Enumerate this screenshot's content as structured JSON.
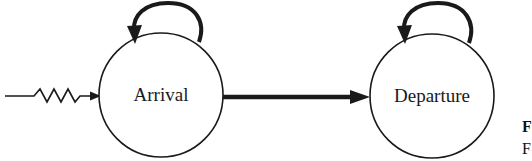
{
  "diagram": {
    "type": "state-transition",
    "states": [
      {
        "id": "arrival",
        "label": "Arrival",
        "has_self_loop": true
      },
      {
        "id": "departure",
        "label": "Departure",
        "has_self_loop": true
      }
    ],
    "transitions": [
      {
        "from": "external",
        "to": "arrival",
        "style": "zigzag-input"
      },
      {
        "from": "arrival",
        "to": "arrival",
        "style": "self-loop"
      },
      {
        "from": "arrival",
        "to": "departure",
        "style": "thick-arrow"
      },
      {
        "from": "departure",
        "to": "departure",
        "style": "self-loop"
      }
    ],
    "caption_fragments": [
      "F",
      "F"
    ]
  },
  "colors": {
    "stroke": "#1a1a1a",
    "background": "#ffffff"
  }
}
